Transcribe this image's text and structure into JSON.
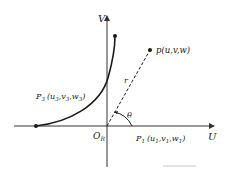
{
  "diagram": {
    "axes": {
      "horizontal_label": "U",
      "vertical_label": "V",
      "origin_label": "O",
      "origin_subscript": "R"
    },
    "points": {
      "p": {
        "name": "p",
        "coords": "(u,v,w)"
      },
      "p1": {
        "name": "P",
        "sub": "1",
        "coords_open": "(u",
        "u_sub": "1",
        "v": ",v",
        "v_sub": "1",
        "w": ",w",
        "w_sub": "1",
        "close": ")"
      },
      "p3": {
        "name": "P",
        "sub": "3",
        "coords_open": "(u",
        "u_sub": "3",
        "v": ",v",
        "v_sub": "3",
        "w": ",w",
        "w_sub": "3",
        "close": ")"
      }
    },
    "radius_label": "r",
    "angle_label": "θ",
    "colors": {
      "stroke": "#1a1a1a",
      "axis": "#333333",
      "faint": "#c8c8c8"
    }
  }
}
